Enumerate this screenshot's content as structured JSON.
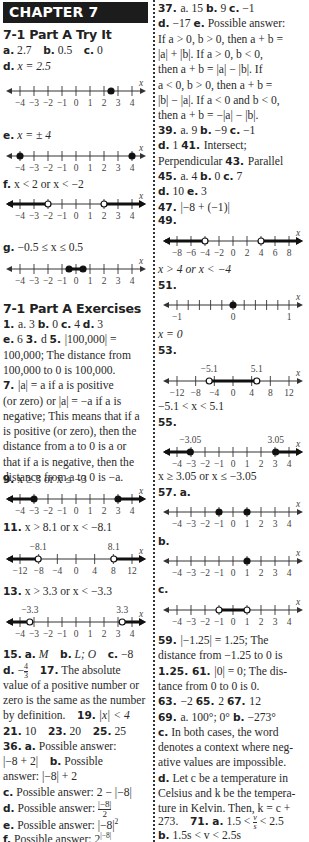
{
  "header": {
    "chapter": "CHAPTER 7"
  },
  "left": {
    "try_it_title": "7-1 Part A Try It",
    "try_it_line1": [
      {
        "label": "a.",
        "value": "2.7"
      },
      {
        "label": "b.",
        "value": "0.5"
      },
      {
        "label": "c.",
        "value": "0"
      }
    ],
    "d": {
      "label": "d.",
      "value": "x = 2.5"
    },
    "e": {
      "label": "e.",
      "value": "x = ± 4"
    },
    "f": {
      "label": "f.",
      "value": "x < 2 or x < −2"
    },
    "g": {
      "label": "g.",
      "value": "−0.5 ≤ x ≤ 0.5"
    },
    "exercises_title": "7-1 Part A Exercises",
    "ex_lines": [
      "1. a. 3   b. 0   c. 4   d. 3",
      "e. 6   3. d   5. |100,000| =",
      "100,000; The distance from",
      "100,000 to 0 is 100,000.",
      "7. |a| = a if a is positive",
      "(or zero) or |a| = −a if a is",
      "negative; This means that if a",
      "is positive (or zero), then the",
      "distance from a to 0 is a or",
      "that if a is negative, then the",
      "distance from a to 0 is −a."
    ],
    "ex9": {
      "label": "9.",
      "value": "x ≥ 3 or x ≤ −3"
    },
    "ex11": {
      "label": "11.",
      "value": "x > 8.1 or x < −8.1"
    },
    "ex13": {
      "label": "13.",
      "value": "x > 3.3 or x < −3.3"
    },
    "ex15": {
      "num": "15.",
      "a": "M",
      "b": "L; O",
      "c": "−8",
      "d_num": "4",
      "d_den": "3"
    },
    "ex17": {
      "label": "17.",
      "text1": "The absolute",
      "text2": "value of a positive number or",
      "text3": "zero is the same as the number",
      "text4": "by definition."
    },
    "ex19": {
      "label": "19.",
      "value": "|x| < 4"
    },
    "ex21_25": [
      {
        "label": "21.",
        "value": "10"
      },
      {
        "label": "23.",
        "value": "20"
      },
      {
        "label": "25.",
        "value": "25"
      }
    ],
    "ex36": {
      "label": "36.",
      "a_label": "a.",
      "a_text": "Possible answer:",
      "a_value": "|−8 + 2|",
      "b_label": "b.",
      "b_text": "Possible",
      "b_text2": "answer: |−8| + 2",
      "c_label": "c.",
      "c_text": "Possible answer: 2 − |−8|",
      "d_label": "d.",
      "d_text": "Possible answer:",
      "d_num": "|−8|",
      "d_den": "2",
      "e_label": "e.",
      "e_text": "Possible answer: |−8|",
      "e_sup": "2",
      "f_label": "f.",
      "f_text": "Possible answer: 2",
      "f_sup": "|−8|"
    }
  },
  "right": {
    "ex37_lines": [
      "37. a. 15   b. 9   c. −1",
      "d. −17   e. Possible answer:",
      "If a > 0, b > 0, then a + b =",
      "|a| + |b|. If a > 0, b < 0,",
      "then a + b = |a| − |b|. If",
      "a < 0, b > 0, then a + b =",
      "|b| − |a|. If a < 0 and b < 0,",
      "then a + b = −|a| − |b|."
    ],
    "ex39_lines": [
      "39. a. 9   b. −9   c. −1",
      "d. 1   41. Intersect;",
      "Perpendicular   43. Parallel",
      "45. a. 4   b. 0   c. 7",
      "d. 10   e. 3",
      "47. |−8 + (−1)|"
    ],
    "ex49": {
      "label": "49.",
      "answer": "x > 4 or x < −4"
    },
    "ex51": {
      "label": "51.",
      "answer": "x = 0"
    },
    "ex53": {
      "label": "53.",
      "answer": "−5.1 < x < 5.1"
    },
    "ex55": {
      "label": "55.",
      "answer": "x ≥ 3.05 or x ≤ −3.05"
    },
    "ex57": {
      "label": "57.",
      "a": "a.",
      "b": "b.",
      "c": "c."
    },
    "ex59_lines": [
      "59. |−1.25| = 1.25; The",
      "distance from −1.25 to 0 is",
      "1.25.   61. |0| = 0; The dis-",
      "tance from 0 to 0 is 0.",
      "63. −2   65. 2   67. 12",
      "69. a. 100°; 0°   b. −273°",
      "c. In both cases, the word",
      "denotes a context where neg-",
      "ative values are impossible.",
      "d. Let c be a temperature in",
      "Celsius and k be the tempera-",
      "ture in Kelvin. Then, k = c +"
    ],
    "ex71": {
      "pre": "273.",
      "label": "71. a.",
      "value_left": "1.5 <",
      "frac_num": "v",
      "frac_den": "s",
      "value_right": "< 2.5",
      "b_label": "b.",
      "b_value": "1.5s < v < 2.5s"
    }
  },
  "number_lines": {
    "axis_label": "x",
    "d": {
      "ticks": [
        "−4",
        "−3",
        "−2",
        "−1",
        "0",
        "1",
        "2",
        "3",
        "4"
      ],
      "min": -4,
      "max": 4,
      "points": [
        {
          "v": 2.5,
          "closed": true
        }
      ],
      "segments": []
    },
    "e": {
      "ticks": [
        "−4",
        "−3",
        "−2",
        "−1",
        "0",
        "1",
        "2",
        "3",
        "4"
      ],
      "min": -4,
      "max": 4,
      "points": [
        {
          "v": -4,
          "closed": true
        },
        {
          "v": 4,
          "closed": true
        }
      ],
      "segments": []
    },
    "f": {
      "ticks": [
        "−4",
        "−3",
        "−2",
        "−1",
        "0",
        "1",
        "2",
        "3",
        "4"
      ],
      "min": -4,
      "max": 4,
      "points": [
        {
          "v": -2,
          "closed": false
        },
        {
          "v": 2,
          "closed": false
        }
      ],
      "segments": [
        {
          "from": "-inf",
          "to": -2
        },
        {
          "from": 2,
          "to": "inf"
        }
      ]
    },
    "g": {
      "ticks": [
        "−4",
        "−3",
        "−2",
        "−1",
        "0",
        "1",
        "2",
        "3",
        "4"
      ],
      "min": -4,
      "max": 4,
      "points": [
        {
          "v": -0.5,
          "closed": true
        },
        {
          "v": 0.5,
          "closed": true
        }
      ],
      "segments": [
        {
          "from": -0.5,
          "to": 0.5
        }
      ]
    },
    "ex9": {
      "ticks": [
        "−4",
        "−3",
        "−2",
        "−1",
        "0",
        "1",
        "2",
        "3",
        "4"
      ],
      "min": -4,
      "max": 4,
      "points": [
        {
          "v": -3,
          "closed": true
        },
        {
          "v": 3,
          "closed": true
        }
      ],
      "segments": [
        {
          "from": "-inf",
          "to": -3
        },
        {
          "from": 3,
          "to": "inf"
        }
      ]
    },
    "ex11": {
      "ticks": [
        "−12",
        "−8",
        "−4",
        "0",
        "4",
        "8",
        "12"
      ],
      "min": -12,
      "max": 12,
      "top_labels": [
        {
          "v": -8.1,
          "t": "−8.1"
        },
        {
          "v": 8.1,
          "t": "8.1"
        }
      ],
      "points": [
        {
          "v": -8.1,
          "closed": false
        },
        {
          "v": 8.1,
          "closed": false
        }
      ],
      "segments": [
        {
          "from": "-inf",
          "to": -8.1
        },
        {
          "from": 8.1,
          "to": "inf"
        }
      ]
    },
    "ex13": {
      "ticks": [
        "−4",
        "−3",
        "−2",
        "−1",
        "0",
        "1",
        "2",
        "3",
        "4"
      ],
      "min": -4,
      "max": 4,
      "top_labels": [
        {
          "v": -3.3,
          "t": "−3.3"
        },
        {
          "v": 3.3,
          "t": "3.3"
        }
      ],
      "points": [
        {
          "v": -3.3,
          "closed": false
        },
        {
          "v": 3.3,
          "closed": false
        }
      ],
      "segments": [
        {
          "from": "-inf",
          "to": -3.3
        },
        {
          "from": 3.3,
          "to": "inf"
        }
      ]
    },
    "ex49": {
      "ticks": [
        "−8",
        "−6",
        "−4",
        "−2",
        "0",
        "2",
        "4",
        "6",
        "8"
      ],
      "min": -8,
      "max": 8,
      "points": [
        {
          "v": -4,
          "closed": false
        },
        {
          "v": 4,
          "closed": false
        }
      ],
      "segments": [
        {
          "from": "-inf",
          "to": -4
        },
        {
          "from": 4,
          "to": "inf"
        }
      ]
    },
    "ex51": {
      "ticks": [
        "−1",
        "",
        "",
        "",
        "",
        "0",
        "",
        "",
        "",
        "",
        "1"
      ],
      "min": -1,
      "max": 1,
      "points": [
        {
          "v": 0,
          "closed": true
        }
      ],
      "segments": []
    },
    "ex53": {
      "ticks": [
        "−12",
        "−8",
        "−4",
        "0",
        "4",
        "8",
        "12"
      ],
      "min": -12,
      "max": 12,
      "top_labels": [
        {
          "v": -5.1,
          "t": "−5.1"
        },
        {
          "v": 5.1,
          "t": "5.1"
        }
      ],
      "points": [
        {
          "v": -5.1,
          "closed": false
        },
        {
          "v": 5.1,
          "closed": false
        }
      ],
      "segments": [
        {
          "from": -5.1,
          "to": 5.1
        }
      ]
    },
    "ex55": {
      "ticks": [
        "−4",
        "−3",
        "−2",
        "−1",
        "0",
        "1",
        "2",
        "3",
        "4"
      ],
      "min": -4,
      "max": 4,
      "top_labels": [
        {
          "v": -3.05,
          "t": "−3.05"
        },
        {
          "v": 3.05,
          "t": "3.05"
        }
      ],
      "points": [
        {
          "v": -3.05,
          "closed": true
        },
        {
          "v": 3.05,
          "closed": true
        }
      ],
      "segments": [
        {
          "from": "-inf",
          "to": -3.05
        },
        {
          "from": 3.05,
          "to": "inf"
        }
      ]
    },
    "ex57a": {
      "ticks": [
        "−4",
        "−3",
        "−2",
        "−1",
        "0",
        "1",
        "2",
        "3",
        "4"
      ],
      "min": -4,
      "max": 4,
      "points": [
        {
          "v": -1,
          "closed": true
        },
        {
          "v": 1,
          "closed": true
        }
      ],
      "segments": []
    },
    "ex57b": {
      "ticks": [
        "−4",
        "−3",
        "−2",
        "−1",
        "0",
        "1",
        "2",
        "3",
        "4"
      ],
      "min": -4,
      "max": 4,
      "points": [
        {
          "v": 1,
          "closed": true
        }
      ],
      "segments": []
    },
    "ex57c": {
      "ticks": [
        "−4",
        "−3",
        "−2",
        "−1",
        "0",
        "1",
        "2",
        "3",
        "4"
      ],
      "min": -4,
      "max": 4,
      "points": [
        {
          "v": -1,
          "closed": false
        },
        {
          "v": 1,
          "closed": false
        }
      ],
      "segments": [
        {
          "from": -1,
          "to": 1
        }
      ]
    }
  }
}
